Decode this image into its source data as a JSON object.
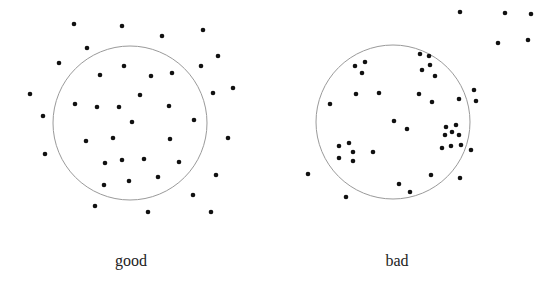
{
  "panels": [
    {
      "label": "good",
      "circle": {
        "cx": 130,
        "cy": 123,
        "r": 77
      },
      "points": [
        [
          74,
          24
        ],
        [
          122,
          26
        ],
        [
          162,
          36
        ],
        [
          203,
          30
        ],
        [
          87,
          48
        ],
        [
          59,
          63
        ],
        [
          218,
          56
        ],
        [
          124,
          66
        ],
        [
          100,
          75
        ],
        [
          151,
          76
        ],
        [
          172,
          73
        ],
        [
          201,
          66
        ],
        [
          30,
          94
        ],
        [
          140,
          95
        ],
        [
          213,
          93
        ],
        [
          233,
          88
        ],
        [
          75,
          104
        ],
        [
          97,
          107
        ],
        [
          119,
          107
        ],
        [
          169,
          106
        ],
        [
          43,
          116
        ],
        [
          132,
          122
        ],
        [
          194,
          120
        ],
        [
          86,
          141
        ],
        [
          113,
          138
        ],
        [
          170,
          139
        ],
        [
          228,
          138
        ],
        [
          45,
          154
        ],
        [
          105,
          163
        ],
        [
          122,
          160
        ],
        [
          144,
          159
        ],
        [
          179,
          162
        ],
        [
          216,
          175
        ],
        [
          104,
          185
        ],
        [
          129,
          181
        ],
        [
          158,
          177
        ],
        [
          193,
          195
        ],
        [
          95,
          206
        ],
        [
          148,
          212
        ],
        [
          211,
          212
        ]
      ]
    },
    {
      "label": "bad",
      "circle": {
        "cx": 393,
        "cy": 122,
        "r": 77
      },
      "points": [
        [
          460,
          12
        ],
        [
          505,
          13
        ],
        [
          531,
          14
        ],
        [
          498,
          43
        ],
        [
          528,
          40
        ],
        [
          420,
          54
        ],
        [
          429,
          56
        ],
        [
          422,
          70
        ],
        [
          430,
          65
        ],
        [
          435,
          76
        ],
        [
          419,
          94
        ],
        [
          432,
          102
        ],
        [
          459,
          99
        ],
        [
          474,
          90
        ],
        [
          476,
          101
        ],
        [
          355,
          66
        ],
        [
          365,
          62
        ],
        [
          362,
          73
        ],
        [
          356,
          94
        ],
        [
          379,
          93
        ],
        [
          330,
          104
        ],
        [
          394,
          121
        ],
        [
          407,
          129
        ],
        [
          446,
          127
        ],
        [
          456,
          125
        ],
        [
          445,
          135
        ],
        [
          452,
          132
        ],
        [
          459,
          135
        ],
        [
          442,
          148
        ],
        [
          451,
          146
        ],
        [
          461,
          145
        ],
        [
          471,
          150
        ],
        [
          339,
          146
        ],
        [
          349,
          143
        ],
        [
          353,
          152
        ],
        [
          339,
          158
        ],
        [
          353,
          161
        ],
        [
          373,
          152
        ],
        [
          308,
          174
        ],
        [
          431,
          175
        ],
        [
          460,
          178
        ],
        [
          399,
          184
        ],
        [
          410,
          192
        ],
        [
          346,
          197
        ]
      ]
    }
  ],
  "colors": {
    "dot": "#111111",
    "circle": "#9a9a9a"
  }
}
